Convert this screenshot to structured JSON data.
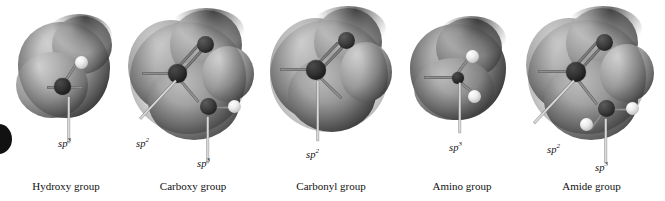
{
  "figure": {
    "type": "molecular-electrostatic-surface-panels",
    "panel_count": 5,
    "background_color": "#ffffff",
    "surface_color_light": "#cfcfcf",
    "surface_color_dark": "#232323",
    "atom_color_dark": "#1d1d1d",
    "atom_color_light": "#ededed",
    "leader_color": "#d8d8d8"
  },
  "panels": [
    {
      "id": "hydroxy",
      "caption": "Hydroxy group",
      "hybridization_labels": [
        {
          "base": "sp",
          "exponent": "3"
        }
      ]
    },
    {
      "id": "carboxy",
      "caption": "Carboxy group",
      "hybridization_labels": [
        {
          "base": "sp",
          "exponent": "2"
        },
        {
          "base": "sp",
          "exponent": "3"
        }
      ]
    },
    {
      "id": "carbonyl",
      "caption": "Carbonyl group",
      "hybridization_labels": [
        {
          "base": "sp",
          "exponent": "2"
        }
      ]
    },
    {
      "id": "amino",
      "caption": "Amino group",
      "hybridization_labels": [
        {
          "base": "sp",
          "exponent": "3"
        }
      ]
    },
    {
      "id": "amide",
      "caption": "Amide group",
      "hybridization_labels": [
        {
          "base": "sp",
          "exponent": "2"
        },
        {
          "base": "sp",
          "exponent": "3"
        }
      ]
    }
  ]
}
